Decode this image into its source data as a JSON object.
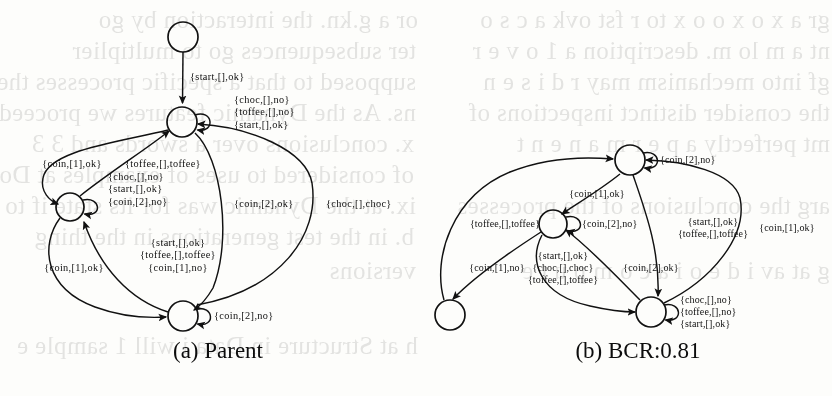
{
  "figure": {
    "background_color": "#fdfdfb",
    "ink_color": "#111111",
    "panels": [
      {
        "id": "a",
        "caption": "(a) Parent",
        "caption_x": 218,
        "caption_y": 338,
        "states": [
          {
            "name": "start-state",
            "cx": 183,
            "cy": 37,
            "r": 15
          },
          {
            "name": "state-top",
            "cx": 182,
            "cy": 122,
            "r": 15
          },
          {
            "name": "state-left",
            "cx": 70,
            "cy": 207,
            "r": 14
          },
          {
            "name": "state-bottom",
            "cx": 183,
            "cy": 316,
            "r": 15
          }
        ],
        "labels": [
          {
            "name": "label-start-ok",
            "x": 190,
            "y": 77,
            "align": "left",
            "lines": [
              "{start,[],ok}"
            ]
          },
          {
            "name": "label-top-selfloop",
            "x": 234,
            "y": 113,
            "align": "left",
            "lines": [
              "{choc,[],no}",
              "{toffee,[],no}",
              "{start,[],ok}"
            ]
          },
          {
            "name": "label-coin1-ok-upper",
            "x": 72,
            "y": 164,
            "align": "center",
            "lines": [
              "{coin,[1],ok}"
            ]
          },
          {
            "name": "label-toffee-toffee",
            "x": 163,
            "y": 164,
            "align": "center",
            "lines": [
              "{toffee,[],toffee}"
            ]
          },
          {
            "name": "label-left-selfloop",
            "x": 108,
            "y": 190,
            "align": "left",
            "lines": [
              "{choc,[],no}",
              "{start,[],ok}",
              "{coin,[2],no}"
            ]
          },
          {
            "name": "label-coin2-ok",
            "x": 234,
            "y": 204,
            "align": "left",
            "lines": [
              "{coin,[2],ok}"
            ]
          },
          {
            "name": "label-choc-choc",
            "x": 326,
            "y": 204,
            "align": "left",
            "lines": [
              "{choc,[],choc}"
            ]
          },
          {
            "name": "label-coin1-ok-lower",
            "x": 74,
            "y": 268,
            "align": "center",
            "lines": [
              "{coin,[1],ok}"
            ]
          },
          {
            "name": "label-left-to-bottom",
            "x": 178,
            "y": 256,
            "align": "center",
            "lines": [
              "{start,[],ok}",
              "{toffee,[],toffee}",
              "{coin,[1],no}"
            ]
          },
          {
            "name": "label-bottom-selfloop",
            "x": 214,
            "y": 316,
            "align": "left",
            "lines": [
              "{coin,[2],no}"
            ]
          }
        ]
      },
      {
        "id": "b",
        "caption": "(b) BCR:0.81",
        "caption_x": 638,
        "caption_y": 338,
        "states": [
          {
            "name": "state-top",
            "cx": 630,
            "cy": 160,
            "r": 15
          },
          {
            "name": "state-middle",
            "cx": 553,
            "cy": 224,
            "r": 14
          },
          {
            "name": "state-bottomleft",
            "cx": 450,
            "cy": 315,
            "r": 15
          },
          {
            "name": "state-bottomright",
            "cx": 651,
            "cy": 312,
            "r": 15
          }
        ],
        "labels": [
          {
            "name": "label-top-selfloop",
            "x": 660,
            "y": 160,
            "align": "left",
            "lines": [
              "{coin,[2],no}"
            ]
          },
          {
            "name": "label-coin1-ok-top",
            "x": 597,
            "y": 194,
            "align": "center",
            "lines": [
              "{coin,[1],ok}"
            ]
          },
          {
            "name": "label-toffee-toffee",
            "x": 505,
            "y": 224,
            "align": "center",
            "lines": [
              "{toffee,[],toffee}"
            ]
          },
          {
            "name": "label-middle-selfloop",
            "x": 582,
            "y": 224,
            "align": "left",
            "lines": [
              "{coin,[2],no}"
            ]
          },
          {
            "name": "label-start-toffee-right",
            "x": 713,
            "y": 228,
            "align": "center",
            "lines": [
              "{start,[],ok}",
              "{toffee,[],toffee}"
            ]
          },
          {
            "name": "label-coin1-ok-right",
            "x": 787,
            "y": 228,
            "align": "center",
            "lines": [
              "{coin,[1],ok}"
            ]
          },
          {
            "name": "label-coin1-no",
            "x": 497,
            "y": 268,
            "align": "center",
            "lines": [
              "{coin,[1],no}"
            ]
          },
          {
            "name": "label-middle-to-br",
            "x": 563,
            "y": 268,
            "align": "center",
            "lines": [
              "{start,[],ok}",
              "{choc,[],choc}",
              "{toffee,[],toffee}"
            ]
          },
          {
            "name": "label-coin2-ok",
            "x": 651,
            "y": 268,
            "align": "center",
            "lines": [
              "{coin,[2],ok}"
            ]
          },
          {
            "name": "label-br-selfloop",
            "x": 680,
            "y": 312,
            "align": "left",
            "lines": [
              "{choc,[],no}",
              "{toffee,[],no}",
              "{start,[],ok}"
            ]
          }
        ]
      }
    ]
  },
  "bleedthrough": {
    "note": "faint mirrored text showing through from the reverse side of the scanned page",
    "lines": [
      {
        "x": 18,
        "y": 4,
        "text": "or a g.kn. the interaction by go"
      },
      {
        "x": 16,
        "y": 35,
        "text": "ter  subsequences go to multiplier"
      },
      {
        "x": 16,
        "y": 66,
        "text": "supposed to that a specific processes the"
      },
      {
        "x": 16,
        "y": 97,
        "text": "ns. As the Dynamic features we proceed scores"
      },
      {
        "x": 14,
        "y": 128,
        "text": "x. conclusions  over  a  swords and 3 3"
      },
      {
        "x": 14,
        "y": 159,
        "text": "of considered to  uses of examples at Do s t a t i n g"
      },
      {
        "x": 16,
        "y": 190,
        "text": "ix. at the Dynamic was for its state if to c"
      },
      {
        "x": 14,
        "y": 221,
        "text": "b. in the test generations in the thing"
      },
      {
        "x": 16,
        "y": 255,
        "text": "versions"
      },
      {
        "x": 18,
        "y": 330,
        "text": "h at Structure in Data i will 1 sample e"
      },
      {
        "x": 430,
        "y": 4,
        "text": "gr a x o  x o o x to r fst ovk a c s o"
      },
      {
        "x": 430,
        "y": 35,
        "text": "nt a m lo m. description  a 1 o v e r"
      },
      {
        "x": 430,
        "y": 66,
        "text": "gf  into mechanism may r d i s e n"
      },
      {
        "x": 430,
        "y": 97,
        "text": "the  consider  distinct inspections of"
      },
      {
        "x": 430,
        "y": 128,
        "text": "mt  perfectly  a  p e r m a n e n t"
      },
      {
        "x": 430,
        "y": 190,
        "text": "arg  the conclusions of the processes"
      },
      {
        "x": 430,
        "y": 255,
        "text": "g at av i d e o  i  a  c o m p u t e"
      }
    ]
  }
}
